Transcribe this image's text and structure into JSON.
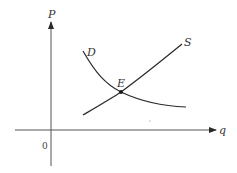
{
  "diagram": {
    "axes": {
      "y_label": "P",
      "x_label": "q",
      "origin_label": "0"
    },
    "curves": [
      {
        "name": "demand",
        "label": "D"
      },
      {
        "name": "supply",
        "label": "S"
      }
    ],
    "equilibrium": {
      "label": "E"
    },
    "colors": {
      "line": "#2a2a2a",
      "axis": "#555555",
      "background": "#ffffff"
    }
  }
}
